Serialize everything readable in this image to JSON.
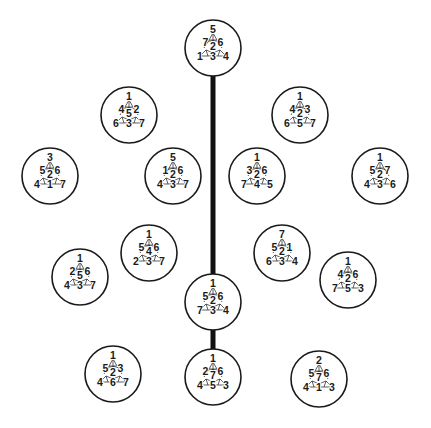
{
  "diagram": {
    "type": "fano-plane-labelings",
    "colors": {
      "stroke": "#1a1a1a",
      "background": "#ffffff",
      "connector": "#111111"
    },
    "connectors": [
      {
        "from": "n0",
        "to": "n11",
        "x": 213,
        "y1": 76,
        "y2": 274,
        "width": 5
      },
      {
        "from": "n11",
        "to": "n13",
        "x": 213,
        "y1": 330,
        "y2": 349,
        "width": 5
      }
    ],
    "nodes": [
      {
        "id": "n0",
        "cx": 213,
        "cy": 48,
        "r": 28,
        "labels": {
          "top": "5",
          "ml": "7",
          "mr": "6",
          "c": "2",
          "bl": "1",
          "bc": "3",
          "br": "4"
        }
      },
      {
        "id": "n1",
        "cx": 129,
        "cy": 115,
        "r": 28,
        "labels": {
          "top": "1",
          "ml": "4",
          "mr": "2",
          "c": "5",
          "bl": "6",
          "bc": "3",
          "br": "7"
        }
      },
      {
        "id": "n2",
        "cx": 300,
        "cy": 115,
        "r": 28,
        "labels": {
          "top": "1",
          "ml": "4",
          "mr": "3",
          "c": "2",
          "bl": "6",
          "bc": "5",
          "br": "7"
        }
      },
      {
        "id": "n3",
        "cx": 50,
        "cy": 176,
        "r": 28,
        "labels": {
          "top": "3",
          "ml": "5",
          "mr": "6",
          "c": "2",
          "bl": "4",
          "bc": "1",
          "br": "7"
        }
      },
      {
        "id": "n4",
        "cx": 173,
        "cy": 176,
        "r": 28,
        "labels": {
          "top": "5",
          "ml": "1",
          "mr": "6",
          "c": "2",
          "bl": "4",
          "bc": "3",
          "br": "7"
        }
      },
      {
        "id": "n5",
        "cx": 257,
        "cy": 176,
        "r": 28,
        "labels": {
          "top": "1",
          "ml": "3",
          "mr": "6",
          "c": "2",
          "bl": "7",
          "bc": "4",
          "br": "5"
        }
      },
      {
        "id": "n6",
        "cx": 380,
        "cy": 176,
        "r": 28,
        "labels": {
          "top": "1",
          "ml": "5",
          "mr": "7",
          "c": "2",
          "bl": "4",
          "bc": "3",
          "br": "6"
        }
      },
      {
        "id": "n7",
        "cx": 80,
        "cy": 277,
        "r": 28,
        "labels": {
          "top": "1",
          "ml": "2",
          "mr": "6",
          "c": "5",
          "bl": "4",
          "bc": "3",
          "br": "7"
        }
      },
      {
        "id": "n8",
        "cx": 149,
        "cy": 253,
        "r": 28,
        "labels": {
          "top": "1",
          "ml": "5",
          "mr": "6",
          "c": "4",
          "bl": "2",
          "bc": "3",
          "br": "7"
        }
      },
      {
        "id": "n9",
        "cx": 282,
        "cy": 253,
        "r": 28,
        "labels": {
          "top": "7",
          "ml": "5",
          "mr": "1",
          "c": "2",
          "bl": "6",
          "bc": "3",
          "br": "4"
        }
      },
      {
        "id": "n10",
        "cx": 348,
        "cy": 280,
        "r": 28,
        "labels": {
          "top": "1",
          "ml": "4",
          "mr": "6",
          "c": "2",
          "bl": "7",
          "bc": "5",
          "br": "3"
        }
      },
      {
        "id": "n11",
        "cx": 213,
        "cy": 302,
        "r": 28,
        "labels": {
          "top": "1",
          "ml": "5",
          "mr": "6",
          "c": "2",
          "bl": "7",
          "bc": "3",
          "br": "4"
        }
      },
      {
        "id": "n12",
        "cx": 113,
        "cy": 374,
        "r": 28,
        "labels": {
          "top": "1",
          "ml": "5",
          "mr": "3",
          "c": "2",
          "bl": "4",
          "bc": "6",
          "br": "7"
        }
      },
      {
        "id": "n13",
        "cx": 213,
        "cy": 377,
        "r": 28,
        "labels": {
          "top": "1",
          "ml": "2",
          "mr": "6",
          "c": "7",
          "bl": "4",
          "bc": "5",
          "br": "3"
        }
      },
      {
        "id": "n14",
        "cx": 319,
        "cy": 379,
        "r": 28,
        "labels": {
          "top": "2",
          "ml": "5",
          "mr": "6",
          "c": "7",
          "bl": "4",
          "bc": "1",
          "br": "3"
        }
      }
    ]
  }
}
